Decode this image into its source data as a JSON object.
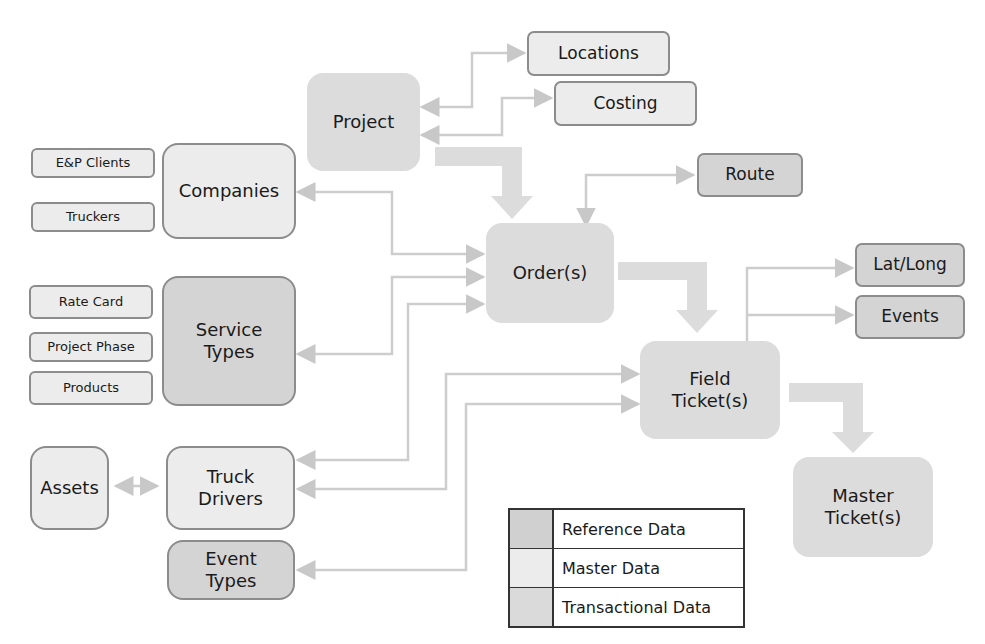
{
  "diagram": {
    "nodes": {
      "project": {
        "label": "Project",
        "category": "transactional"
      },
      "locations": {
        "label": "Locations",
        "category": "master"
      },
      "costing": {
        "label": "Costing",
        "category": "master"
      },
      "companies": {
        "label": "Companies",
        "category": "master"
      },
      "ep_clients": {
        "label": "E&P Clients",
        "category": "master"
      },
      "truckers": {
        "label": "Truckers",
        "category": "master"
      },
      "route": {
        "label": "Route",
        "category": "reference"
      },
      "orders": {
        "label": "Order(s)",
        "category": "transactional"
      },
      "service_types": {
        "label": "Service\nTypes",
        "category": "reference"
      },
      "rate_card": {
        "label": "Rate Card",
        "category": "master"
      },
      "project_phase": {
        "label": "Project Phase",
        "category": "master"
      },
      "products": {
        "label": "Products",
        "category": "master"
      },
      "lat_long": {
        "label": "Lat/Long",
        "category": "reference"
      },
      "events": {
        "label": "Events",
        "category": "reference"
      },
      "field_tickets": {
        "label": "Field\nTicket(s)",
        "category": "transactional"
      },
      "assets": {
        "label": "Assets",
        "category": "master"
      },
      "truck_drivers": {
        "label": "Truck\nDrivers",
        "category": "master"
      },
      "event_types": {
        "label": "Event\nTypes",
        "category": "reference"
      },
      "master_tickets": {
        "label": "Master\nTicket(s)",
        "category": "transactional"
      }
    },
    "flows": [
      {
        "from": "Project",
        "to": "Order(s)",
        "type": "main"
      },
      {
        "from": "Order(s)",
        "to": "Field Ticket(s)",
        "type": "main"
      },
      {
        "from": "Field Ticket(s)",
        "to": "Master Ticket(s)",
        "type": "main"
      },
      {
        "from": "Project",
        "to": "Locations",
        "type": "link"
      },
      {
        "from": "Project",
        "to": "Costing",
        "type": "link"
      },
      {
        "from": "Order(s)",
        "to": "Route",
        "type": "link"
      },
      {
        "from": "Order(s)",
        "to": "Companies",
        "type": "link"
      },
      {
        "from": "Order(s)",
        "to": "Service Types",
        "type": "link"
      },
      {
        "from": "Order(s)",
        "to": "Truck Drivers",
        "type": "link"
      },
      {
        "from": "Field Ticket(s)",
        "to": "Truck Drivers",
        "type": "link"
      },
      {
        "from": "Field Ticket(s)",
        "to": "Event Types",
        "type": "link"
      },
      {
        "from": "Field Ticket(s)",
        "to": "Lat/Long",
        "type": "link"
      },
      {
        "from": "Field Ticket(s)",
        "to": "Events",
        "type": "link"
      },
      {
        "from": "Assets",
        "to": "Truck Drivers",
        "type": "link"
      }
    ]
  },
  "legend": {
    "items": [
      {
        "label": "Reference Data",
        "color": "#d0d0d0"
      },
      {
        "label": "Master Data",
        "color": "#ececec"
      },
      {
        "label": "Transactional Data",
        "color": "#dadada"
      }
    ]
  },
  "colors": {
    "reference": "#d4d4d4",
    "master": "#ececec",
    "transactional": "#dcdcdc",
    "connector": "#cfcfcf",
    "border": "#8c8c8c"
  }
}
